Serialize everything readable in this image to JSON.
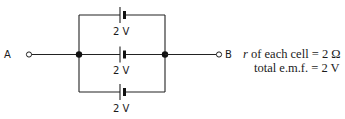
{
  "diagram": {
    "type": "circuit",
    "terminals": [
      {
        "id": "A",
        "label": "A"
      },
      {
        "id": "B",
        "label": "B"
      }
    ],
    "cells": [
      {
        "position": "top",
        "label": "2 V"
      },
      {
        "position": "middle",
        "label": "2 V"
      },
      {
        "position": "bottom",
        "label": "2 V"
      }
    ],
    "annotations": {
      "line1_italic": "r",
      "line1_rest": " of each cell = 2 Ω",
      "line2": "total e.m.f. = 2 V"
    }
  }
}
